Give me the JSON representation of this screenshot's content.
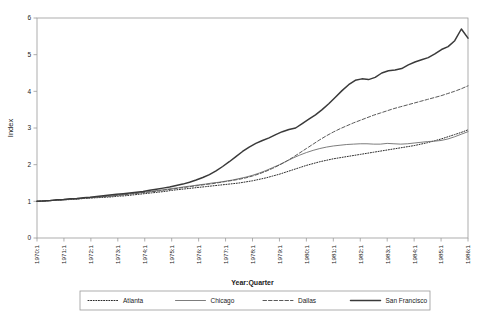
{
  "chart_data": {
    "type": "line",
    "title": "",
    "xlabel": "Year:Quarter",
    "ylabel": "Index",
    "ylim": [
      0,
      6
    ],
    "yticks": [
      0,
      1,
      2,
      3,
      4,
      5,
      6
    ],
    "grid": false,
    "legend_position": "bottom",
    "x_tick_labels": [
      "1970:1",
      "1971:1",
      "1972:1",
      "1973:1",
      "1974:1",
      "1975:1",
      "1976:1",
      "1977:1",
      "1978:1",
      "1979:1",
      "1980:1",
      "1981:1",
      "1982:1",
      "1983:1",
      "1984:1",
      "1985:1",
      "1986:1"
    ],
    "x_index_range": [
      0,
      64
    ],
    "series": [
      {
        "name": "Atlanta",
        "style": "dotted",
        "color": "#2b2b2b",
        "width": 1.0,
        "values": [
          1.0,
          1.01,
          1.02,
          1.03,
          1.04,
          1.05,
          1.06,
          1.08,
          1.09,
          1.1,
          1.11,
          1.12,
          1.14,
          1.15,
          1.17,
          1.19,
          1.21,
          1.23,
          1.25,
          1.27,
          1.3,
          1.32,
          1.34,
          1.36,
          1.38,
          1.4,
          1.42,
          1.44,
          1.46,
          1.48,
          1.5,
          1.53,
          1.56,
          1.6,
          1.64,
          1.69,
          1.74,
          1.8,
          1.86,
          1.92,
          1.98,
          2.03,
          2.08,
          2.12,
          2.16,
          2.19,
          2.22,
          2.25,
          2.28,
          2.31,
          2.34,
          2.37,
          2.4,
          2.43,
          2.46,
          2.49,
          2.52,
          2.56,
          2.6,
          2.65,
          2.7,
          2.76,
          2.82,
          2.88,
          2.95
        ]
      },
      {
        "name": "Chicago",
        "style": "solid-thin",
        "color": "#6e6e6e",
        "width": 0.9,
        "values": [
          1.0,
          1.01,
          1.02,
          1.03,
          1.05,
          1.06,
          1.07,
          1.09,
          1.1,
          1.12,
          1.13,
          1.15,
          1.17,
          1.19,
          1.21,
          1.23,
          1.25,
          1.27,
          1.3,
          1.32,
          1.35,
          1.37,
          1.4,
          1.42,
          1.45,
          1.47,
          1.5,
          1.52,
          1.55,
          1.58,
          1.62,
          1.66,
          1.71,
          1.77,
          1.84,
          1.92,
          2.0,
          2.09,
          2.18,
          2.26,
          2.33,
          2.39,
          2.44,
          2.48,
          2.51,
          2.53,
          2.55,
          2.56,
          2.57,
          2.57,
          2.56,
          2.56,
          2.58,
          2.57,
          2.56,
          2.57,
          2.59,
          2.61,
          2.63,
          2.64,
          2.66,
          2.7,
          2.76,
          2.83,
          2.9
        ]
      },
      {
        "name": "Dallas",
        "style": "dashed",
        "color": "#5a5a5a",
        "width": 1.0,
        "values": [
          1.0,
          1.01,
          1.02,
          1.03,
          1.04,
          1.06,
          1.07,
          1.08,
          1.1,
          1.11,
          1.13,
          1.14,
          1.16,
          1.18,
          1.2,
          1.22,
          1.24,
          1.26,
          1.28,
          1.31,
          1.33,
          1.36,
          1.38,
          1.41,
          1.43,
          1.46,
          1.48,
          1.51,
          1.54,
          1.57,
          1.6,
          1.64,
          1.69,
          1.75,
          1.82,
          1.9,
          1.99,
          2.09,
          2.2,
          2.32,
          2.44,
          2.56,
          2.68,
          2.79,
          2.89,
          2.98,
          3.06,
          3.14,
          3.21,
          3.28,
          3.35,
          3.41,
          3.47,
          3.53,
          3.58,
          3.63,
          3.68,
          3.73,
          3.78,
          3.83,
          3.88,
          3.94,
          4.0,
          4.07,
          4.15
        ]
      },
      {
        "name": "San Francisco",
        "style": "solid-thick",
        "color": "#3a3a3a",
        "width": 1.5,
        "values": [
          1.0,
          1.01,
          1.02,
          1.04,
          1.05,
          1.07,
          1.08,
          1.1,
          1.11,
          1.13,
          1.15,
          1.17,
          1.19,
          1.21,
          1.23,
          1.25,
          1.27,
          1.3,
          1.33,
          1.36,
          1.39,
          1.43,
          1.47,
          1.52,
          1.58,
          1.65,
          1.73,
          1.83,
          1.95,
          2.08,
          2.22,
          2.36,
          2.48,
          2.58,
          2.66,
          2.73,
          2.82,
          2.9,
          2.96,
          3.0,
          3.12,
          3.24,
          3.36,
          3.5,
          3.66,
          3.84,
          4.02,
          4.18,
          4.3,
          4.34,
          4.32,
          4.38,
          4.5,
          4.56,
          4.58,
          4.62,
          4.72,
          4.8,
          4.86,
          4.92,
          5.02,
          5.14,
          5.22,
          5.38,
          5.7
        ],
        "final_dip_value": 5.45
      }
    ]
  },
  "legend": {
    "items": [
      {
        "label": "Atlanta"
      },
      {
        "label": "Chicago"
      },
      {
        "label": "Dallas"
      },
      {
        "label": "San Francisco"
      }
    ]
  }
}
